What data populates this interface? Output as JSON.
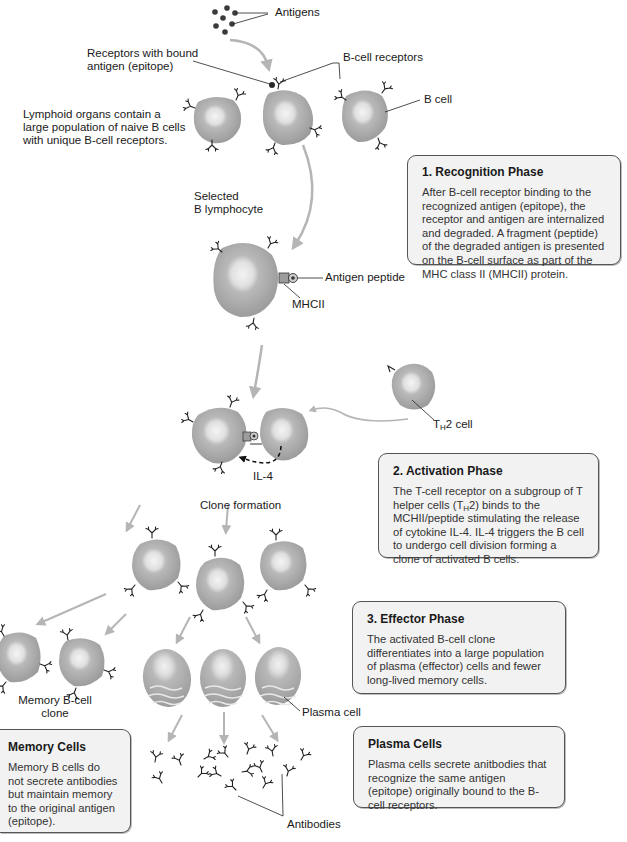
{
  "labels": {
    "antigens": "Antigens",
    "receptors_bound_1": "Receptors with bound",
    "receptors_bound_2": "antigen (epitope)",
    "bcell_receptors": "B-cell receptors",
    "b_cell": "B cell",
    "lymphoid_1": "Lymphoid organs contain a",
    "lymphoid_2": "large population of naive B cells",
    "lymphoid_3": "with unique B-cell receptors.",
    "selected_1": "Selected",
    "selected_2": "B lymphocyte",
    "antigen_peptide": "Antigen peptide",
    "mhcii": "MHCII",
    "th2_prefix": "T",
    "th2_sub": "H",
    "th2_suffix": "2 cell",
    "il4": "IL-4",
    "clone_formation": "Clone formation",
    "memory_clone_1": "Memory B-cell",
    "memory_clone_2": "clone",
    "plasma_cell": "Plasma cell",
    "antibodies": "Antibodies"
  },
  "boxes": {
    "recognition": {
      "title": "1. Recognition Phase",
      "body": "After B-cell receptor binding to the recognized antigen (epitope), the receptor and antigen are internalized and degraded. A fragment (peptide) of the degraded antigen is presented on the B-cell surface as part of the MHC class II (MHCII) protein."
    },
    "activation": {
      "title": "2. Activation Phase",
      "body_pre": "The T-cell receptor on a subgroup of T helper cells (T",
      "body_sub": "H",
      "body_post": "2) binds to the MCHII/peptide stimulating the release of cytokine IL-4. IL-4 triggers the B cell to undergo cell division forming a clone of activated B cells."
    },
    "effector": {
      "title": "3. Effector Phase",
      "body": "The activated B-cell clone differentiates into a large population of plasma (effector) cells and fewer long-lived memory cells."
    },
    "memory": {
      "title": "Memory Cells",
      "body": "Memory B cells do not secrete antibodies but maintain memory to the original antigen (epitope)."
    },
    "plasma": {
      "title": "Plasma Cells",
      "body": "Plasma cells secrete anitbodies that recognize the same antigen (epitope) originally bound to the B-cell receptors."
    }
  },
  "colors": {
    "cell_outer": "#a3a3a3",
    "cell_inner": "#e4e4e4",
    "arrow": "#b5b5b5",
    "box_fill": "#f2f2f2",
    "box_border": "#555555",
    "ink": "#1a1a1a"
  }
}
